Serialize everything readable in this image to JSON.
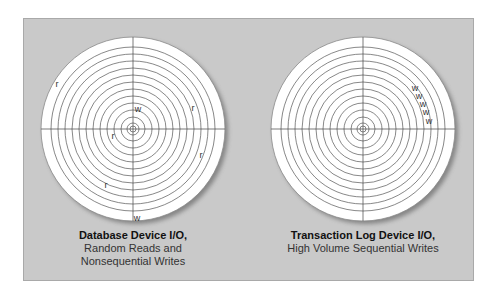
{
  "figure": {
    "background_color": "#c9c9c9",
    "disk_color": "#ffffff",
    "track_color": "#555555",
    "track_radii": [
      3,
      6,
      12,
      19,
      26,
      33,
      40,
      47,
      54,
      61,
      68,
      75,
      82
    ],
    "disks": [
      {
        "name": "database-device",
        "center": [
          133,
          129
        ],
        "radius": 92,
        "marks": [
          {
            "label": "r",
            "x": 57,
            "y": 87
          },
          {
            "label": "w",
            "x": 138,
            "y": 112
          },
          {
            "label": "r",
            "x": 193,
            "y": 111
          },
          {
            "label": "r",
            "x": 113,
            "y": 139
          },
          {
            "label": "r",
            "x": 201,
            "y": 158
          },
          {
            "label": "r",
            "x": 106,
            "y": 188
          },
          {
            "label": "w",
            "x": 137,
            "y": 221
          }
        ],
        "caption": {
          "title": "Database Device I/O,",
          "lines": [
            "Random Reads and",
            "Nonsequential Writes"
          ]
        }
      },
      {
        "name": "transaction-log-device",
        "center": [
          363,
          129
        ],
        "radius": 92,
        "marks": [
          {
            "label": "w",
            "x": 415,
            "y": 91
          },
          {
            "label": "w",
            "x": 419,
            "y": 99
          },
          {
            "label": "w",
            "x": 423,
            "y": 107
          },
          {
            "label": "w",
            "x": 426,
            "y": 115
          },
          {
            "label": "w",
            "x": 429,
            "y": 124
          }
        ],
        "caption": {
          "title": "Transaction Log Device I/O,",
          "lines": [
            "High Volume Sequential Writes"
          ]
        }
      }
    ]
  }
}
